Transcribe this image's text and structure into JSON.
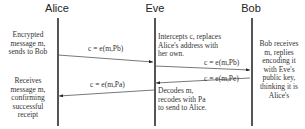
{
  "actors": [
    {
      "name": "Alice"
    },
    {
      "name": "Eve"
    },
    {
      "name": "Bob"
    }
  ],
  "notes": {
    "alice_top": [
      "Encrypted",
      "message m,",
      "sends to Bob"
    ],
    "alice_bottom": [
      "Receives",
      "message m,",
      "confirming",
      "successful",
      "receipt"
    ],
    "eve_top": [
      "Intercepts c, replaces",
      "Alice's address with",
      "her own."
    ],
    "eve_bottom": [
      "Decodes m,",
      "recodes with Pa",
      "to send to Alice."
    ],
    "bob": [
      "Bob receives",
      "m, replies",
      "encoding it",
      "with Eve's",
      "public key,",
      "thinking it is",
      "Alice's"
    ]
  },
  "messages": [
    {
      "label": "c = e(m,Pb)",
      "from": "Alice",
      "to": "Eve"
    },
    {
      "label": "c = e(m,Pb)",
      "from": "Eve",
      "to": "Bob"
    },
    {
      "label": "c = e(m,Pe)",
      "from": "Bob",
      "to": "Eve"
    },
    {
      "label": "c = e(m,Pa)",
      "from": "Eve",
      "to": "Alice"
    }
  ]
}
